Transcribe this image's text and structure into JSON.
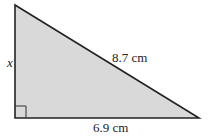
{
  "diagram": {
    "type": "right-triangle",
    "fill_color": "#d9d9d9",
    "stroke_color": "#222222",
    "labels": {
      "vertical_side": "x",
      "hypotenuse": "8.7 cm",
      "base": "6.9 cm"
    },
    "right_angle_marker": true
  }
}
